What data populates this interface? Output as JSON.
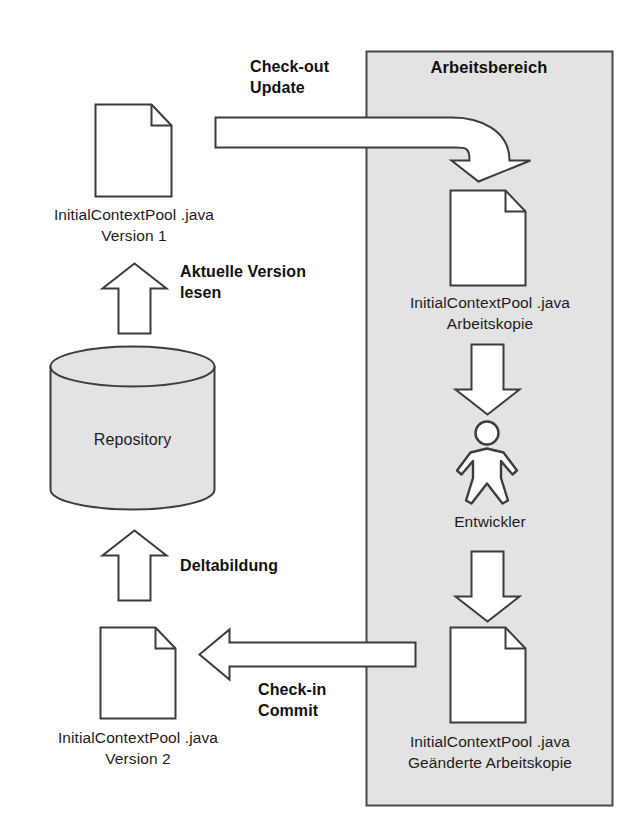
{
  "diagram": {
    "workspace": {
      "label": "Arbeitsbereich",
      "fill_color": "#e3e3e3",
      "border_color": "#4a4a4a"
    },
    "repository": {
      "label": "Repository",
      "fill_color": "#e3e3e3",
      "border_color": "#3c3c3c"
    },
    "documents": [
      {
        "id": "doc-version-1",
        "line1": "InitialContextPool .java",
        "line2": "Version 1"
      },
      {
        "id": "doc-working-copy",
        "line1": "InitialContextPool .java",
        "line2": "Arbeitskopie"
      },
      {
        "id": "doc-version-2",
        "line1": "InitialContextPool .java",
        "line2": "Version 2"
      },
      {
        "id": "doc-modified-working-copy",
        "line1": "InitialContextPool .java",
        "line2": "Geänderte Arbeitskopie"
      }
    ],
    "actor": {
      "label": "Entwickler"
    },
    "arrows": [
      {
        "id": "arrow-checkout",
        "line1": "Check-out",
        "line2": "Update",
        "direction": "right-then-down"
      },
      {
        "id": "arrow-read-current-version",
        "line1": "Aktuelle Version",
        "line2": "lesen",
        "direction": "up"
      },
      {
        "id": "arrow-delta",
        "line1": "Deltabildung",
        "line2": "",
        "direction": "up"
      },
      {
        "id": "arrow-checkin",
        "line1": "Check-in",
        "line2": "Commit",
        "direction": "left"
      },
      {
        "id": "arrow-to-developer",
        "line1": "",
        "line2": "",
        "direction": "down"
      },
      {
        "id": "arrow-from-developer",
        "line1": "",
        "line2": "",
        "direction": "down"
      }
    ],
    "colors": {
      "stroke": "#3c3c3c",
      "fill_white": "#ffffff",
      "fill_gray": "#e3e3e3",
      "text": "#1a1a1a"
    }
  }
}
